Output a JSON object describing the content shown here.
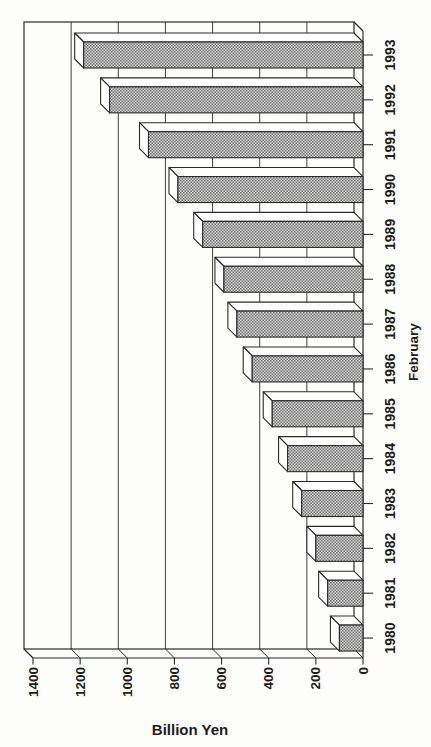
{
  "chart_data": {
    "type": "bar",
    "presentation": "3d-bar-chart rotated 90 degrees counterclockwise on the page (landscape chart printed sideways); bars run horizontally from the right-side baseline toward the left; category axis on the right edge, value axis along the bottom",
    "title": "",
    "categories": [
      "1980",
      "1981",
      "1982",
      "1983",
      "1984",
      "1985",
      "1986",
      "1987",
      "1988",
      "1989",
      "1990",
      "1991",
      "1992",
      "1993"
    ],
    "values": [
      100,
      150,
      200,
      260,
      320,
      385,
      470,
      535,
      590,
      680,
      785,
      910,
      1075,
      1185
    ],
    "xlabel": "February",
    "ylabel": "Billion Yen",
    "value_axis": {
      "min": 0,
      "max": 1400,
      "step": 200,
      "ticks": [
        0,
        200,
        400,
        600,
        800,
        1000,
        1200,
        1400
      ],
      "tick_labels": [
        "0",
        "200",
        "400",
        "600",
        "800",
        "1000",
        "1200",
        "1400"
      ]
    },
    "category_axis": {
      "order_top_to_bottom": [
        "1993",
        "1992",
        "1991",
        "1990",
        "1989",
        "1988",
        "1987",
        "1986",
        "1985",
        "1984",
        "1983",
        "1982",
        "1981",
        "1980"
      ]
    },
    "grid": "on",
    "legend": "none",
    "colors": {
      "line": "#2b2b2b",
      "text": "#1d1d1d",
      "bar_hatch_dark": "#6e6e6e",
      "bar_hatch_light": "#dcdcdc",
      "side_faces": "#ffffff",
      "background": "#fdfdfc"
    }
  }
}
